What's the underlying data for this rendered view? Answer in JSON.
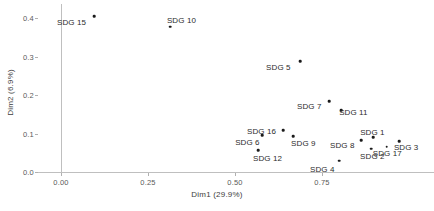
{
  "chart_data": {
    "type": "scatter",
    "title": "",
    "xlabel": "Dim1 (29.9%)",
    "ylabel": "Dim2 (6.9%)",
    "xlim": [
      -0.07,
      1.02
    ],
    "ylim": [
      -0.015,
      0.44
    ],
    "xticks": [
      "0.00",
      "0.25",
      "0.50",
      "0.75"
    ],
    "xtick_values": [
      0.0,
      0.25,
      0.5,
      0.75
    ],
    "yticks": [
      "0.0",
      "0.1",
      "0.2",
      "0.3",
      "0.4"
    ],
    "ytick_values": [
      0.0,
      0.1,
      0.2,
      0.3,
      0.4
    ],
    "grid": false,
    "legend": "none",
    "points": [
      {
        "label": "SDG 15",
        "x": 0.095,
        "y": 0.405,
        "label_dx": -37,
        "label_dy": 2
      },
      {
        "label": "SDG 10",
        "x": 0.313,
        "y": 0.377,
        "label_dx": -3,
        "label_dy": -11
      },
      {
        "label": "SDG 5",
        "x": 0.687,
        "y": 0.288,
        "label_dx": -34,
        "label_dy": 2
      },
      {
        "label": "SDG 7",
        "x": 0.77,
        "y": 0.184,
        "label_dx": -32,
        "label_dy": 1
      },
      {
        "label": "SDG 11",
        "x": 0.805,
        "y": 0.161,
        "label_dx": -2,
        "label_dy": -2
      },
      {
        "label": "SDG 16",
        "x": 0.638,
        "y": 0.109,
        "label_dx": -36,
        "label_dy": -3
      },
      {
        "label": "SDG 6",
        "x": 0.578,
        "y": 0.096,
        "label_dx": -27,
        "label_dy": 3
      },
      {
        "label": "SDG 9",
        "x": 0.667,
        "y": 0.093,
        "label_dx": -2,
        "label_dy": 3
      },
      {
        "label": "SDG 12",
        "x": 0.566,
        "y": 0.057,
        "label_dx": -5,
        "label_dy": 4
      },
      {
        "label": "SDG 1",
        "x": 0.897,
        "y": 0.091,
        "label_dx": -13,
        "label_dy": -9
      },
      {
        "label": "SDG 8",
        "x": 0.862,
        "y": 0.083,
        "label_dx": -31,
        "label_dy": 1
      },
      {
        "label": "SDG 3",
        "x": 0.971,
        "y": 0.08,
        "label_dx": -5,
        "label_dy": 2
      },
      {
        "label": "SDG 17",
        "x": 0.936,
        "y": 0.066,
        "label_dx": -14,
        "label_dy": 2
      },
      {
        "label": "SDG 2",
        "x": 0.891,
        "y": 0.06,
        "label_dx": -11,
        "label_dy": 3
      },
      {
        "label": "SDG 4",
        "x": 0.799,
        "y": 0.029,
        "label_dx": -29,
        "label_dy": 4
      }
    ]
  },
  "axes": {
    "x_title": "Dim1 (29.9%)",
    "y_title": "Dim2 (6.9%)"
  }
}
